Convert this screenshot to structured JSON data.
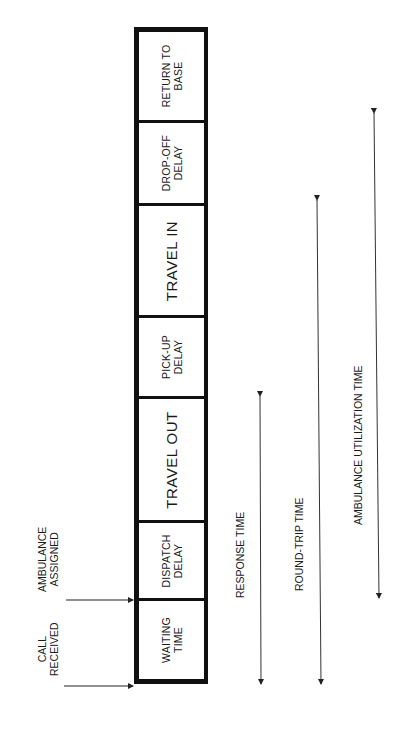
{
  "diagram": {
    "segments": [
      {
        "id": "return-to-base",
        "line1": "RETURN TO",
        "line2": "BASE",
        "big": false
      },
      {
        "id": "drop-off-delay",
        "line1": "DROP-OFF",
        "line2": "DELAY",
        "big": false
      },
      {
        "id": "travel-in",
        "line1": "TRAVEL IN",
        "line2": "",
        "big": true
      },
      {
        "id": "pick-up-delay",
        "line1": "PICK-UP",
        "line2": "DELAY",
        "big": false
      },
      {
        "id": "travel-out",
        "line1": "TRAVEL OUT",
        "line2": "",
        "big": true
      },
      {
        "id": "dispatch-delay",
        "line1": "DISPATCH",
        "line2": "DELAY",
        "big": false
      },
      {
        "id": "waiting-time",
        "line1": "WAITING",
        "line2": "TIME",
        "big": false
      }
    ],
    "events": {
      "call_received": {
        "line1": "CALL",
        "line2": "RECEIVED"
      },
      "ambulance_assigned": {
        "line1": "AMBULANCE",
        "line2": "ASSIGNED"
      }
    },
    "intervals": {
      "response_time": "RESPONSE TIME",
      "round_trip_time": "ROUND-TRIP TIME",
      "utilization_time": "AMBULANCE UTILIZATION TIME"
    }
  }
}
